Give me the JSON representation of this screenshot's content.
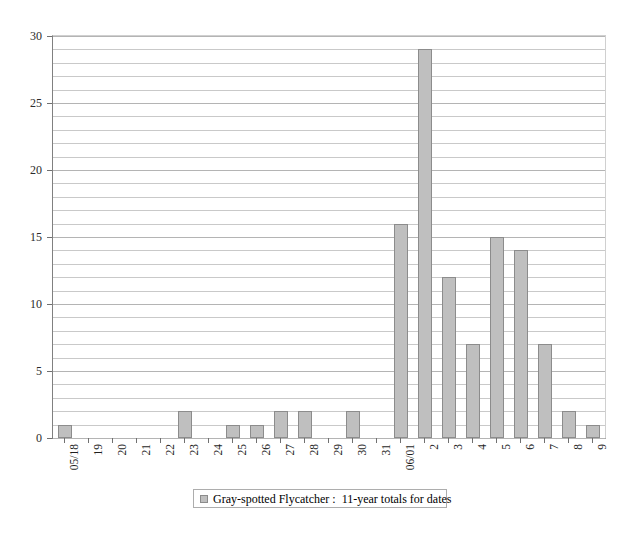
{
  "top_caption": "",
  "chart_data": {
    "type": "bar",
    "title": "",
    "xlabel": "",
    "ylabel": "",
    "ylim": [
      0,
      30
    ],
    "ytick_step": 5,
    "gridline_step": 1,
    "grid": true,
    "legend_position": "bottom",
    "bar_color": "#bfbfbf",
    "bar_border_color": "#8c8c8c",
    "categories": [
      "05/18",
      "19",
      "20",
      "21",
      "22",
      "23",
      "24",
      "25",
      "26",
      "27",
      "28",
      "29",
      "30",
      "31",
      "06/01",
      "2",
      "3",
      "4",
      "5",
      "6",
      "7",
      "8",
      "9"
    ],
    "values": [
      1,
      0,
      0,
      0,
      0,
      2,
      0,
      1,
      1,
      2,
      2,
      0,
      2,
      0,
      16,
      29,
      12,
      7,
      15,
      14,
      7,
      2,
      1
    ],
    "ytick_labels": [
      "0",
      "5",
      "10",
      "15",
      "20",
      "25",
      "30"
    ],
    "ytick_values": [
      0,
      5,
      10,
      15,
      20,
      25,
      30
    ],
    "series": [
      {
        "name": "Gray-spotted Flycatcher :  11-year totals for dates",
        "values": [
          1,
          0,
          0,
          0,
          0,
          2,
          0,
          1,
          1,
          2,
          2,
          0,
          2,
          0,
          16,
          29,
          12,
          7,
          15,
          14,
          7,
          2,
          1
        ]
      }
    ]
  },
  "legend": {
    "label": "Gray-spotted Flycatcher :  11-year totals for dates"
  }
}
